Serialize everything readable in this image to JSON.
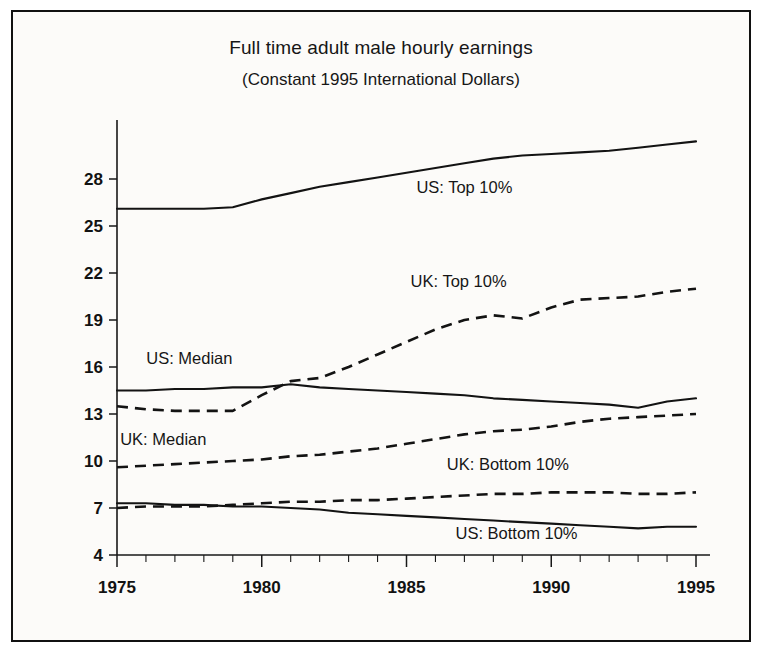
{
  "figure": {
    "title": "Full time adult male hourly earnings",
    "subtitle": "(Constant 1995 International Dollars)",
    "border_color": "#111111",
    "background_color": "#fcfbf9"
  },
  "chart_data": {
    "type": "line",
    "title": "Full time adult male hourly earnings",
    "subtitle": "(Constant 1995 International Dollars)",
    "xlabel": "",
    "ylabel": "",
    "xlim": [
      1975,
      1995
    ],
    "ylim": [
      4,
      31
    ],
    "grid": false,
    "legend": "inline-labels",
    "x_ticks": [
      1975,
      1980,
      1985,
      1990,
      1995
    ],
    "x_tick_labels": [
      "1975",
      "1980",
      "1985",
      "1990",
      "1995"
    ],
    "x_minor_tick_step": 1,
    "y_ticks": [
      4,
      7,
      10,
      13,
      16,
      19,
      22,
      25,
      28
    ],
    "y_tick_labels": [
      "4",
      "7",
      "10",
      "13",
      "16",
      "19",
      "22",
      "25",
      "28"
    ],
    "x": [
      1975,
      1976,
      1977,
      1978,
      1979,
      1980,
      1981,
      1982,
      1983,
      1984,
      1985,
      1986,
      1987,
      1988,
      1989,
      1990,
      1991,
      1992,
      1993,
      1994,
      1995
    ],
    "series": [
      {
        "name": "US: Top 10%",
        "style": "solid",
        "label_x": 1987.0,
        "label_y": 27.1,
        "values": [
          26.1,
          26.1,
          26.1,
          26.1,
          26.2,
          26.7,
          27.1,
          27.5,
          27.8,
          28.1,
          28.4,
          28.7,
          29.0,
          29.3,
          29.5,
          29.6,
          29.7,
          29.8,
          30.0,
          30.2,
          30.4
        ]
      },
      {
        "name": "UK: Top 10%",
        "style": "dashed",
        "label_x": 1986.8,
        "label_y": 21.1,
        "values": [
          13.5,
          13.3,
          13.2,
          13.2,
          13.2,
          14.2,
          15.1,
          15.3,
          16.0,
          16.8,
          17.6,
          18.4,
          19.0,
          19.3,
          19.1,
          19.8,
          20.3,
          20.4,
          20.5,
          20.8,
          21.0
        ]
      },
      {
        "name": "US: Median",
        "style": "solid",
        "label_x": 1977.5,
        "label_y": 16.2,
        "values": [
          14.5,
          14.5,
          14.6,
          14.6,
          14.7,
          14.7,
          14.9,
          14.7,
          14.6,
          14.5,
          14.4,
          14.3,
          14.2,
          14.0,
          13.9,
          13.8,
          13.7,
          13.6,
          13.4,
          13.8,
          14.0
        ]
      },
      {
        "name": "UK: Median",
        "style": "dashed",
        "label_x": 1976.6,
        "label_y": 11.0,
        "values": [
          9.6,
          9.7,
          9.8,
          9.9,
          10.0,
          10.1,
          10.3,
          10.4,
          10.6,
          10.8,
          11.1,
          11.4,
          11.7,
          11.9,
          12.0,
          12.2,
          12.5,
          12.7,
          12.8,
          12.9,
          13.0
        ]
      },
      {
        "name": "UK: Bottom 10%",
        "style": "dashed",
        "label_x": 1988.5,
        "label_y": 9.4,
        "values": [
          7.0,
          7.1,
          7.1,
          7.1,
          7.2,
          7.3,
          7.4,
          7.4,
          7.5,
          7.5,
          7.6,
          7.7,
          7.8,
          7.9,
          7.9,
          8.0,
          8.0,
          8.0,
          7.9,
          7.9,
          8.0
        ]
      },
      {
        "name": "US: Bottom 10%",
        "style": "solid",
        "label_x": 1988.8,
        "label_y": 5.0,
        "values": [
          7.3,
          7.3,
          7.2,
          7.2,
          7.1,
          7.1,
          7.0,
          6.9,
          6.7,
          6.6,
          6.5,
          6.4,
          6.3,
          6.2,
          6.1,
          6.0,
          5.9,
          5.8,
          5.7,
          5.8,
          5.8
        ]
      }
    ]
  }
}
